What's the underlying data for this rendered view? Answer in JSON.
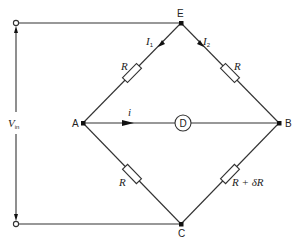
{
  "diagram": {
    "type": "wheatstone-bridge",
    "nodes": {
      "E": {
        "label": "E",
        "x": 181,
        "y": 23
      },
      "A": {
        "label": "A",
        "x": 83,
        "y": 123
      },
      "B": {
        "label": "B",
        "x": 279,
        "y": 123
      },
      "C": {
        "label": "C",
        "x": 181,
        "y": 224
      }
    },
    "terminals": {
      "top": {
        "x": 16,
        "y": 23
      },
      "bottom": {
        "x": 16,
        "y": 224
      }
    },
    "input_voltage": {
      "label": "V",
      "subscript": "in"
    },
    "resistors": {
      "AE": {
        "label": "R"
      },
      "EB": {
        "label": "R"
      },
      "AC": {
        "label": "R"
      },
      "CB": {
        "label": "R + δR"
      }
    },
    "detector": {
      "label": "D"
    },
    "currents": {
      "I1": {
        "label": "I",
        "subscript": "1"
      },
      "I2": {
        "label": "I",
        "subscript": "2"
      },
      "i": {
        "label": "i"
      }
    }
  }
}
